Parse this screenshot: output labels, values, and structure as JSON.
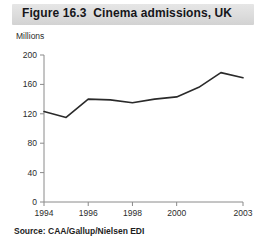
{
  "figure": {
    "title": "Figure 16.3  Cinema admissions, UK",
    "unit_label": "Millions",
    "source": "Source: CAA/Gallup/Nielsen EDI",
    "title_band_color": "#dcdcdc",
    "line_color": "#2a2a2a",
    "axis_color": "#8a8a8a",
    "background_color": "#ffffff"
  },
  "chart_data": {
    "type": "line",
    "title": "Figure 16.3  Cinema admissions, UK",
    "subtitle": "",
    "xlabel": "",
    "ylabel": "Millions",
    "x": [
      1994,
      1995,
      1996,
      1997,
      1998,
      1999,
      2000,
      2001,
      2002,
      2003
    ],
    "series": [
      {
        "name": "Cinema admissions, UK",
        "values": [
          123,
          115,
          140,
          139,
          135,
          140,
          143,
          156,
          176,
          169
        ]
      }
    ],
    "ylim": [
      0,
      200
    ],
    "yticks": [
      0,
      40,
      80,
      120,
      160,
      200
    ],
    "ytick_labels": [
      "0",
      "40",
      "80",
      "120",
      "160",
      "200"
    ],
    "xlim": [
      1994,
      2003
    ],
    "xticks": [
      1994,
      1996,
      1998,
      2000,
      2003
    ],
    "xtick_labels": [
      "1994",
      "1996",
      "1998",
      "2000",
      "2003"
    ],
    "grid": false,
    "legend": false,
    "legend_position": "none",
    "annotations": [
      "Source: CAA/Gallup/Nielsen EDI"
    ]
  }
}
